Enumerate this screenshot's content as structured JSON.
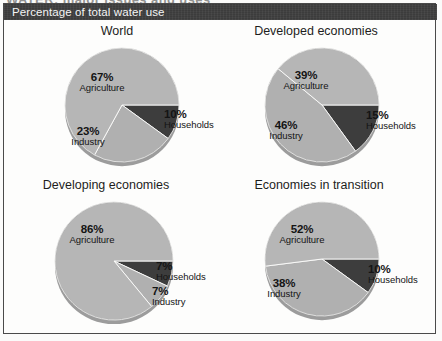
{
  "figure": {
    "clipped_heading": "WATER: major issues and uses",
    "banner_title": "Percentage of total water use"
  },
  "colors": {
    "banner_bg": "#3c3c3c",
    "banner_text": "#f4f4f4",
    "slice_light": "#b6b6b6",
    "slice_light_alt": "#b0b0b0",
    "slice_dark": "#3d3d3d",
    "divider": "#fdfdfc",
    "pie_edge": "#9a9a9a",
    "frame": "#4a4a4a",
    "text": "#141414"
  },
  "chart_data": [
    {
      "type": "pie",
      "title": "World",
      "categories": [
        "Households",
        "Industry",
        "Agriculture"
      ],
      "values": [
        10,
        23,
        67
      ],
      "labels": [
        {
          "pct": "10%",
          "cat": "Households"
        },
        {
          "pct": "23%",
          "cat": "Industry"
        },
        {
          "pct": "67%",
          "cat": "Agriculture"
        }
      ],
      "unit": "percent",
      "ylabel": "Percentage of total water use"
    },
    {
      "type": "pie",
      "title": "Developed economies",
      "categories": [
        "Households",
        "Industry",
        "Agriculture"
      ],
      "values": [
        15,
        46,
        39
      ],
      "labels": [
        {
          "pct": "15%",
          "cat": "Households"
        },
        {
          "pct": "46%",
          "cat": "Industry"
        },
        {
          "pct": "39%",
          "cat": "Agriculture"
        }
      ],
      "unit": "percent",
      "ylabel": "Percentage of total water use"
    },
    {
      "type": "pie",
      "title": "Developing economies",
      "categories": [
        "Households",
        "Industry",
        "Agriculture"
      ],
      "values": [
        7,
        7,
        86
      ],
      "labels": [
        {
          "pct": "7%",
          "cat": "Households"
        },
        {
          "pct": "7%",
          "cat": "Industry"
        },
        {
          "pct": "86%",
          "cat": "Agriculture"
        }
      ],
      "unit": "percent",
      "ylabel": "Percentage of total water use"
    },
    {
      "type": "pie",
      "title": "Economies in transition",
      "categories": [
        "Households",
        "Industry",
        "Agriculture"
      ],
      "values": [
        10,
        38,
        52
      ],
      "labels": [
        {
          "pct": "10%",
          "cat": "Households"
        },
        {
          "pct": "38%",
          "cat": "Industry"
        },
        {
          "pct": "52%",
          "cat": "Agriculture"
        }
      ],
      "unit": "percent",
      "ylabel": "Percentage of total water use"
    }
  ]
}
